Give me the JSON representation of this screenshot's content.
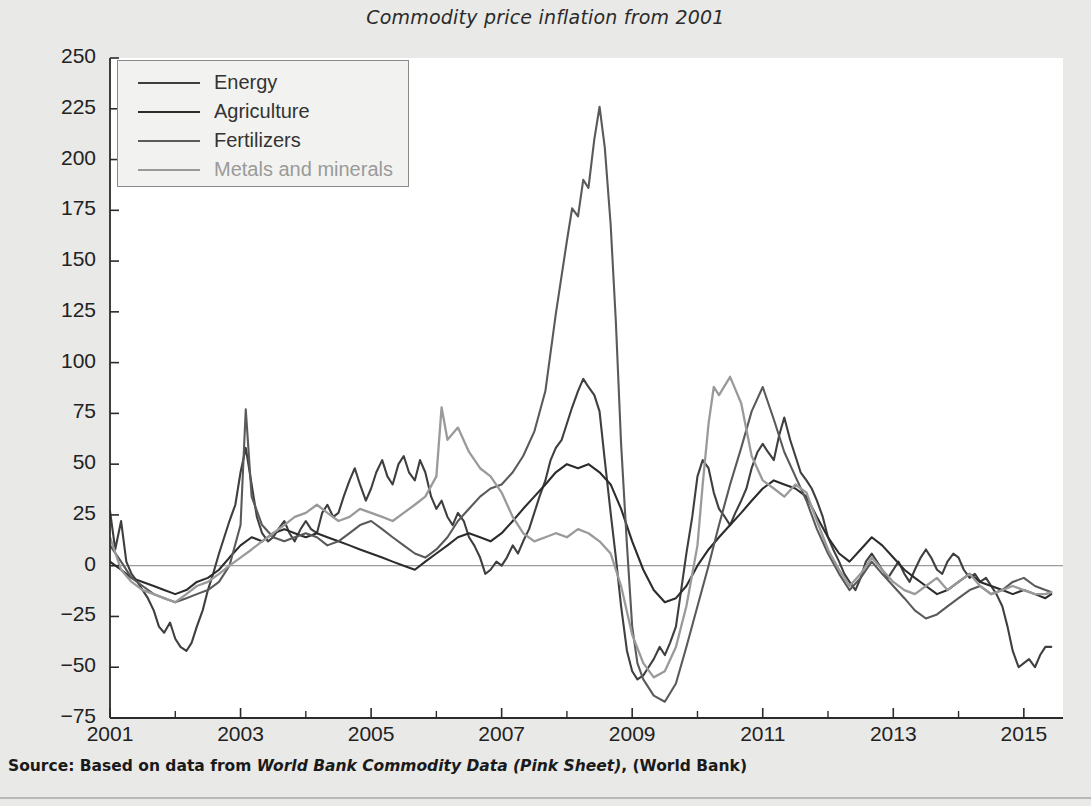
{
  "figure": {
    "title": "Commodity price inflation from 2001",
    "source_prefix": "Source: Based on data from ",
    "source_italic": "World Bank Commodity Data (Pink Sheet)",
    "source_suffix": ", (World Bank)",
    "background_color": "#e9e9e7",
    "plot_background_color": "#ffffff"
  },
  "chart_data": {
    "type": "line",
    "title": "Commodity price inflation from 2001",
    "xlabel": "",
    "ylabel": "Annual rate of price inflation, %",
    "xlim": [
      2001,
      2015.6
    ],
    "ylim": [
      -75,
      250
    ],
    "ytick_labels": [
      "250",
      "225",
      "200",
      "175",
      "150",
      "125",
      "100",
      "75",
      "50",
      "25",
      "0",
      "-25",
      "-50",
      "-75"
    ],
    "ytick_values": [
      250,
      225,
      200,
      175,
      150,
      125,
      100,
      75,
      50,
      25,
      0,
      -25,
      -50,
      -75
    ],
    "xtick_labels": [
      "2001",
      "2003",
      "2005",
      "2007",
      "2009",
      "2011",
      "2013",
      "2015"
    ],
    "xtick_values": [
      2001,
      2003,
      2005,
      2007,
      2009,
      2011,
      2013,
      2015
    ],
    "xminor_ticks": [
      2002,
      2004,
      2006,
      2008,
      2010,
      2012,
      2014
    ],
    "grid": false,
    "zero_line": true,
    "legend_position": "upper-left",
    "series": [
      {
        "name": "Energy",
        "color": "#3f3f3f",
        "width": 2.1,
        "x": [
          2001.0,
          2001.08,
          2001.17,
          2001.25,
          2001.33,
          2001.42,
          2001.5,
          2001.58,
          2001.67,
          2001.75,
          2001.83,
          2001.92,
          2002.0,
          2002.08,
          2002.17,
          2002.25,
          2002.33,
          2002.42,
          2002.5,
          2002.58,
          2002.67,
          2002.75,
          2002.83,
          2002.92,
          2003.0,
          2003.08,
          2003.17,
          2003.25,
          2003.33,
          2003.42,
          2003.5,
          2003.58,
          2003.67,
          2003.75,
          2003.83,
          2003.92,
          2004.0,
          2004.08,
          2004.17,
          2004.25,
          2004.33,
          2004.42,
          2004.5,
          2004.58,
          2004.67,
          2004.75,
          2004.83,
          2004.92,
          2005.0,
          2005.08,
          2005.17,
          2005.25,
          2005.33,
          2005.42,
          2005.5,
          2005.58,
          2005.67,
          2005.75,
          2005.83,
          2005.92,
          2006.0,
          2006.08,
          2006.17,
          2006.25,
          2006.33,
          2006.42,
          2006.5,
          2006.58,
          2006.67,
          2006.75,
          2006.83,
          2006.92,
          2007.0,
          2007.08,
          2007.17,
          2007.25,
          2007.33,
          2007.42,
          2007.5,
          2007.58,
          2007.67,
          2007.75,
          2007.83,
          2007.92,
          2008.0,
          2008.08,
          2008.17,
          2008.25,
          2008.33,
          2008.42,
          2008.5,
          2008.58,
          2008.67,
          2008.75,
          2008.83,
          2008.92,
          2009.0,
          2009.08,
          2009.17,
          2009.25,
          2009.33,
          2009.42,
          2009.5,
          2009.58,
          2009.67,
          2009.75,
          2009.83,
          2009.92,
          2010.0,
          2010.08,
          2010.17,
          2010.25,
          2010.33,
          2010.42,
          2010.5,
          2010.58,
          2010.67,
          2010.75,
          2010.83,
          2010.92,
          2011.0,
          2011.08,
          2011.17,
          2011.25,
          2011.33,
          2011.42,
          2011.5,
          2011.58,
          2011.67,
          2011.75,
          2011.83,
          2011.92,
          2012.0,
          2012.08,
          2012.17,
          2012.25,
          2012.33,
          2012.42,
          2012.5,
          2012.58,
          2012.67,
          2012.75,
          2012.83,
          2012.92,
          2013.0,
          2013.08,
          2013.17,
          2013.25,
          2013.33,
          2013.42,
          2013.5,
          2013.58,
          2013.67,
          2013.75,
          2013.83,
          2013.92,
          2014.0,
          2014.08,
          2014.17,
          2014.25,
          2014.33,
          2014.42,
          2014.5,
          2014.58,
          2014.67,
          2014.75,
          2014.83,
          2014.92,
          2015.0,
          2015.08,
          2015.17,
          2015.25,
          2015.33,
          2015.42
        ],
        "y": [
          27,
          8,
          22,
          2,
          -4,
          -8,
          -12,
          -16,
          -22,
          -30,
          -33,
          -28,
          -36,
          -40,
          -42,
          -38,
          -30,
          -22,
          -12,
          -4,
          6,
          14,
          22,
          30,
          46,
          58,
          40,
          24,
          16,
          12,
          14,
          18,
          22,
          16,
          12,
          18,
          22,
          18,
          16,
          26,
          30,
          24,
          26,
          34,
          42,
          48,
          40,
          32,
          38,
          46,
          52,
          44,
          40,
          50,
          54,
          46,
          42,
          52,
          46,
          34,
          28,
          32,
          24,
          20,
          26,
          22,
          14,
          10,
          4,
          -4,
          -2,
          2,
          0,
          4,
          10,
          6,
          12,
          18,
          26,
          34,
          42,
          52,
          58,
          62,
          70,
          78,
          86,
          92,
          88,
          84,
          76,
          52,
          26,
          4,
          -20,
          -42,
          -52,
          -56,
          -54,
          -50,
          -46,
          -40,
          -44,
          -38,
          -30,
          -12,
          6,
          24,
          44,
          52,
          48,
          36,
          28,
          24,
          20,
          26,
          32,
          38,
          48,
          56,
          60,
          56,
          52,
          64,
          73,
          62,
          54,
          46,
          42,
          38,
          32,
          24,
          14,
          8,
          2,
          -4,
          -8,
          -12,
          -6,
          2,
          6,
          2,
          -2,
          -6,
          -2,
          2,
          -4,
          -8,
          -2,
          4,
          8,
          4,
          -2,
          -4,
          2,
          6,
          4,
          -2,
          -6,
          -4,
          -8,
          -6,
          -10,
          -14,
          -20,
          -30,
          -42,
          -50,
          -48,
          -46,
          -50,
          -44,
          -40,
          -40
        ]
      },
      {
        "name": "Agriculture",
        "color": "#2c2c2c",
        "width": 2.1,
        "x": [
          2001.0,
          2001.17,
          2001.33,
          2001.5,
          2001.67,
          2001.83,
          2002.0,
          2002.17,
          2002.33,
          2002.5,
          2002.67,
          2002.83,
          2003.0,
          2003.17,
          2003.33,
          2003.5,
          2003.67,
          2003.83,
          2004.0,
          2004.17,
          2004.33,
          2004.5,
          2004.67,
          2004.83,
          2005.0,
          2005.17,
          2005.33,
          2005.5,
          2005.67,
          2005.83,
          2006.0,
          2006.17,
          2006.33,
          2006.5,
          2006.67,
          2006.83,
          2007.0,
          2007.17,
          2007.33,
          2007.5,
          2007.67,
          2007.83,
          2008.0,
          2008.17,
          2008.33,
          2008.5,
          2008.67,
          2008.83,
          2009.0,
          2009.17,
          2009.33,
          2009.5,
          2009.67,
          2009.83,
          2010.0,
          2010.17,
          2010.33,
          2010.5,
          2010.67,
          2010.83,
          2011.0,
          2011.17,
          2011.33,
          2011.5,
          2011.67,
          2011.83,
          2012.0,
          2012.17,
          2012.33,
          2012.5,
          2012.67,
          2012.83,
          2013.0,
          2013.17,
          2013.33,
          2013.5,
          2013.67,
          2013.83,
          2014.0,
          2014.17,
          2014.33,
          2014.5,
          2014.67,
          2014.83,
          2015.0,
          2015.17,
          2015.33,
          2015.42
        ],
        "y": [
          2,
          -2,
          -6,
          -8,
          -10,
          -12,
          -14,
          -12,
          -8,
          -6,
          -2,
          4,
          10,
          14,
          12,
          16,
          18,
          16,
          14,
          16,
          14,
          12,
          10,
          8,
          6,
          4,
          2,
          0,
          -2,
          2,
          6,
          10,
          14,
          16,
          14,
          12,
          16,
          22,
          28,
          34,
          40,
          46,
          50,
          48,
          50,
          46,
          40,
          28,
          12,
          -2,
          -12,
          -18,
          -16,
          -10,
          0,
          8,
          14,
          20,
          26,
          32,
          38,
          42,
          40,
          38,
          34,
          24,
          14,
          6,
          2,
          8,
          14,
          10,
          4,
          -2,
          -6,
          -10,
          -14,
          -12,
          -8,
          -4,
          -8,
          -10,
          -12,
          -14,
          -12,
          -14,
          -16,
          -14
        ]
      },
      {
        "name": "Fertilizers",
        "color": "#5a5a5a",
        "width": 2.1,
        "x": [
          2001.0,
          2001.17,
          2001.33,
          2001.5,
          2001.67,
          2001.83,
          2002.0,
          2002.17,
          2002.33,
          2002.5,
          2002.67,
          2002.83,
          2003.0,
          2003.08,
          2003.17,
          2003.33,
          2003.5,
          2003.67,
          2003.83,
          2004.0,
          2004.17,
          2004.33,
          2004.5,
          2004.67,
          2004.83,
          2005.0,
          2005.17,
          2005.33,
          2005.5,
          2005.67,
          2005.83,
          2006.0,
          2006.17,
          2006.33,
          2006.5,
          2006.67,
          2006.83,
          2007.0,
          2007.17,
          2007.33,
          2007.5,
          2007.67,
          2007.83,
          2008.0,
          2008.08,
          2008.17,
          2008.25,
          2008.33,
          2008.42,
          2008.5,
          2008.58,
          2008.67,
          2008.75,
          2008.83,
          2008.92,
          2009.0,
          2009.08,
          2009.17,
          2009.33,
          2009.5,
          2009.67,
          2009.83,
          2010.0,
          2010.17,
          2010.33,
          2010.5,
          2010.67,
          2010.83,
          2011.0,
          2011.17,
          2011.33,
          2011.5,
          2011.67,
          2011.83,
          2012.0,
          2012.17,
          2012.33,
          2012.5,
          2012.67,
          2012.83,
          2013.0,
          2013.17,
          2013.33,
          2013.5,
          2013.67,
          2013.83,
          2014.0,
          2014.17,
          2014.33,
          2014.5,
          2014.67,
          2014.83,
          2015.0,
          2015.17,
          2015.33,
          2015.42
        ],
        "y": [
          10,
          2,
          -6,
          -10,
          -14,
          -16,
          -18,
          -16,
          -14,
          -12,
          -8,
          0,
          20,
          77,
          34,
          20,
          14,
          12,
          14,
          16,
          14,
          10,
          12,
          16,
          20,
          22,
          18,
          14,
          10,
          6,
          4,
          8,
          14,
          22,
          28,
          34,
          38,
          40,
          46,
          54,
          66,
          86,
          124,
          160,
          176,
          172,
          190,
          186,
          210,
          226,
          206,
          168,
          120,
          60,
          10,
          -30,
          -48,
          -56,
          -64,
          -67,
          -58,
          -40,
          -20,
          0,
          20,
          40,
          58,
          76,
          88,
          72,
          56,
          44,
          32,
          18,
          6,
          -4,
          -12,
          -6,
          2,
          -4,
          -10,
          -16,
          -22,
          -26,
          -24,
          -20,
          -16,
          -12,
          -10,
          -14,
          -12,
          -8,
          -6,
          -10,
          -12,
          -13
        ]
      },
      {
        "name": "Metals and minerals",
        "color": "#9a9a9a",
        "width": 2.3,
        "x": [
          2001.0,
          2001.17,
          2001.33,
          2001.5,
          2001.67,
          2001.83,
          2002.0,
          2002.17,
          2002.33,
          2002.5,
          2002.67,
          2002.83,
          2003.0,
          2003.17,
          2003.33,
          2003.5,
          2003.67,
          2003.83,
          2004.0,
          2004.17,
          2004.33,
          2004.5,
          2004.67,
          2004.83,
          2005.0,
          2005.17,
          2005.33,
          2005.5,
          2005.67,
          2005.83,
          2006.0,
          2006.08,
          2006.17,
          2006.33,
          2006.5,
          2006.67,
          2006.83,
          2007.0,
          2007.17,
          2007.33,
          2007.5,
          2007.67,
          2007.83,
          2008.0,
          2008.17,
          2008.33,
          2008.5,
          2008.67,
          2008.83,
          2009.0,
          2009.17,
          2009.33,
          2009.5,
          2009.67,
          2009.83,
          2010.0,
          2010.08,
          2010.17,
          2010.25,
          2010.33,
          2010.5,
          2010.67,
          2010.83,
          2011.0,
          2011.17,
          2011.33,
          2011.5,
          2011.67,
          2011.83,
          2012.0,
          2012.17,
          2012.33,
          2012.5,
          2012.67,
          2012.83,
          2013.0,
          2013.17,
          2013.33,
          2013.5,
          2013.67,
          2013.83,
          2014.0,
          2014.17,
          2014.33,
          2014.5,
          2014.67,
          2014.83,
          2015.0,
          2015.17,
          2015.33,
          2015.42
        ],
        "y": [
          14,
          -2,
          -8,
          -12,
          -14,
          -16,
          -18,
          -14,
          -10,
          -8,
          -4,
          0,
          4,
          8,
          12,
          16,
          20,
          24,
          26,
          30,
          26,
          22,
          24,
          28,
          26,
          24,
          22,
          26,
          30,
          34,
          44,
          78,
          62,
          68,
          56,
          48,
          44,
          36,
          24,
          16,
          12,
          14,
          16,
          14,
          18,
          16,
          12,
          6,
          -10,
          -34,
          -48,
          -55,
          -52,
          -40,
          -20,
          10,
          40,
          70,
          88,
          84,
          93,
          80,
          54,
          42,
          38,
          34,
          40,
          36,
          22,
          8,
          -2,
          -10,
          -4,
          4,
          -2,
          -8,
          -12,
          -14,
          -10,
          -6,
          -12,
          -8,
          -4,
          -10,
          -14,
          -12,
          -10,
          -12,
          -14,
          -14,
          -13
        ]
      }
    ]
  },
  "yaxis": {
    "label": "Annual rate of price inflation, %"
  },
  "legend": {
    "entries": [
      {
        "label": "Energy"
      },
      {
        "label": "Agriculture"
      },
      {
        "label": "Fertilizers"
      },
      {
        "label": "Metals and minerals"
      }
    ]
  }
}
